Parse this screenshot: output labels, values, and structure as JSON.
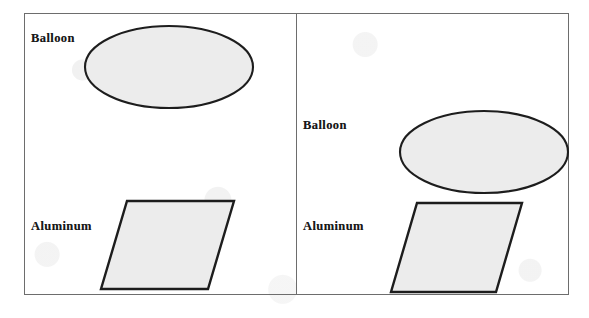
{
  "figure": {
    "background_color": "#ffffff",
    "frame_color": "#6d6d6d",
    "shape_fill_color": "#ececec",
    "shape_stroke_color": "#1d1d1d",
    "panels": [
      {
        "id": "left",
        "name": "panel-left",
        "description": "Balloon held far above the aluminum sheet",
        "balloon": {
          "label": "Balloon",
          "shape": "ellipse",
          "label_x": 6,
          "label_y": 17,
          "cx": 144,
          "cy": 53,
          "rx": 84,
          "ry": 41
        },
        "aluminum": {
          "label": "Aluminum",
          "shape": "parallelogram",
          "label_x": 6,
          "label_y": 205,
          "points": "102,187 209,187 183,275 76,275"
        }
      },
      {
        "id": "right",
        "name": "panel-right",
        "description": "Balloon lowered close to the aluminum sheet",
        "balloon": {
          "label": "Balloon",
          "shape": "ellipse",
          "label_x": 6,
          "label_y": 104,
          "cx": 187,
          "cy": 138,
          "rx": 84,
          "ry": 41
        },
        "aluminum": {
          "label": "Aluminum",
          "shape": "parallelogram",
          "label_x": 6,
          "label_y": 205,
          "points": "120,189 225,189 199,278 94,278"
        }
      }
    ]
  }
}
